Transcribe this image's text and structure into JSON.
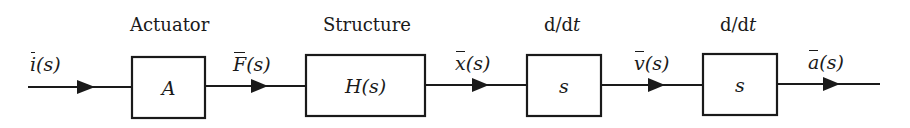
{
  "diagram": {
    "type": "block-diagram",
    "line_color": "#1a1a1a",
    "blocks": [
      {
        "id": "actuator",
        "title": "Actuator",
        "content": "A"
      },
      {
        "id": "structure",
        "title": "Structure",
        "content": "H(s)"
      },
      {
        "id": "diff1",
        "title_prefix": "d/d",
        "title_var": "t",
        "content": "s"
      },
      {
        "id": "diff2",
        "title_prefix": "d/d",
        "title_var": "t",
        "content": "s"
      }
    ],
    "signals": [
      {
        "id": "input",
        "var": "i",
        "arg": "(s)"
      },
      {
        "id": "force",
        "var": "F",
        "arg": "(s)"
      },
      {
        "id": "displacement",
        "var": "x",
        "arg": "(s)"
      },
      {
        "id": "velocity",
        "var": "v",
        "arg": "(s)"
      },
      {
        "id": "acceleration",
        "var": "a",
        "arg": "(s)"
      }
    ]
  }
}
